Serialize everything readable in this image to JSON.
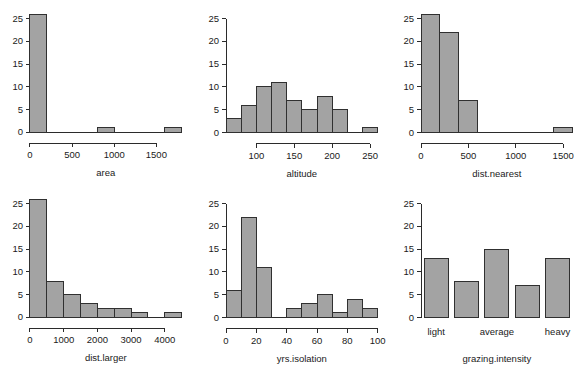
{
  "figure": {
    "layout": "2x3 grid of histograms",
    "background_color": "#ffffff",
    "bar_fill_color": "#a3a3a3",
    "bar_border_color": "#303030",
    "axis_color": "#2b2b2b",
    "text_color": "#1a1a1a"
  },
  "chart_data": [
    {
      "type": "bar",
      "title": "",
      "xlabel": "area",
      "ylabel": "",
      "grid": false,
      "legend": "none",
      "ylim": [
        0,
        26
      ],
      "y_ticks": [
        0,
        5,
        10,
        15,
        20,
        25
      ],
      "y_tick_labels": [
        "0",
        "5",
        "10",
        "15",
        "20",
        "25"
      ],
      "xlim": [
        0,
        1800
      ],
      "x_ticks": [
        0,
        500,
        1000,
        1500
      ],
      "x_tick_labels": [
        "0",
        "500",
        "1000",
        "1500"
      ],
      "bin_edges": [
        0,
        200,
        400,
        600,
        800,
        1000,
        1200,
        1400,
        1600,
        1800
      ],
      "categories": [
        "0-200",
        "200-400",
        "400-600",
        "600-800",
        "800-1000",
        "1000-1200",
        "1200-1400",
        "1400-1600",
        "1600-1800"
      ],
      "values": [
        26,
        0,
        0,
        0,
        1,
        0,
        0,
        0,
        1
      ]
    },
    {
      "type": "bar",
      "title": "",
      "xlabel": "altitude",
      "ylabel": "",
      "grid": false,
      "legend": "none",
      "ylim": [
        0,
        26
      ],
      "y_ticks": [
        0,
        5,
        10,
        15,
        20,
        25
      ],
      "y_tick_labels": [
        "0",
        "5",
        "10",
        "15",
        "20",
        "25"
      ],
      "xlim": [
        60,
        260
      ],
      "x_ticks": [
        100,
        150,
        200,
        250
      ],
      "x_tick_labels": [
        "100",
        "150",
        "200",
        "250"
      ],
      "bin_edges": [
        60,
        80,
        100,
        120,
        140,
        160,
        180,
        200,
        220,
        240,
        260
      ],
      "categories": [
        "60-80",
        "80-100",
        "100-120",
        "120-140",
        "140-160",
        "160-180",
        "180-200",
        "200-220",
        "220-240",
        "240-260"
      ],
      "values": [
        3,
        6,
        10,
        11,
        7,
        5,
        8,
        5,
        0,
        1
      ]
    },
    {
      "type": "bar",
      "title": "",
      "xlabel": "dist.nearest",
      "ylabel": "",
      "grid": false,
      "legend": "none",
      "ylim": [
        0,
        26
      ],
      "y_ticks": [
        0,
        5,
        10,
        15,
        20,
        25
      ],
      "y_tick_labels": [
        "0",
        "5",
        "10",
        "15",
        "20",
        "25"
      ],
      "xlim": [
        0,
        1600
      ],
      "x_ticks": [
        0,
        500,
        1000,
        1500
      ],
      "x_tick_labels": [
        "0",
        "500",
        "1000",
        "1500"
      ],
      "bin_edges": [
        0,
        200,
        400,
        600,
        800,
        1000,
        1200,
        1400,
        1600
      ],
      "categories": [
        "0-200",
        "200-400",
        "400-600",
        "600-800",
        "800-1000",
        "1000-1200",
        "1200-1400",
        "1400-1600"
      ],
      "values": [
        26,
        22,
        7,
        0,
        0,
        0,
        0,
        1
      ]
    },
    {
      "type": "bar",
      "title": "",
      "xlabel": "dist.larger",
      "ylabel": "",
      "grid": false,
      "legend": "none",
      "ylim": [
        0,
        26
      ],
      "y_ticks": [
        0,
        5,
        10,
        15,
        20,
        25
      ],
      "y_tick_labels": [
        "0",
        "5",
        "10",
        "15",
        "20",
        "25"
      ],
      "xlim": [
        0,
        4500
      ],
      "x_ticks": [
        0,
        1000,
        2000,
        3000,
        4000
      ],
      "x_tick_labels": [
        "0",
        "1000",
        "2000",
        "3000",
        "4000"
      ],
      "bin_edges": [
        0,
        500,
        1000,
        1500,
        2000,
        2500,
        3000,
        3500,
        4000,
        4500
      ],
      "categories": [
        "0-500",
        "500-1000",
        "1000-1500",
        "1500-2000",
        "2000-2500",
        "2500-3000",
        "3000-3500",
        "3500-4000",
        "4000-4500"
      ],
      "values": [
        26,
        8,
        5,
        3,
        2,
        2,
        1,
        0,
        1
      ]
    },
    {
      "type": "bar",
      "title": "",
      "xlabel": "yrs.isolation",
      "ylabel": "",
      "grid": false,
      "legend": "none",
      "ylim": [
        0,
        26
      ],
      "y_ticks": [
        0,
        5,
        10,
        15,
        20,
        25
      ],
      "y_tick_labels": [
        "0",
        "5",
        "10",
        "15",
        "20",
        "25"
      ],
      "xlim": [
        0,
        100
      ],
      "x_ticks": [
        0,
        20,
        40,
        60,
        80,
        100
      ],
      "x_tick_labels": [
        "0",
        "20",
        "40",
        "60",
        "80",
        "100"
      ],
      "bin_edges": [
        0,
        10,
        20,
        30,
        40,
        50,
        60,
        70,
        80,
        90,
        100
      ],
      "categories": [
        "0-10",
        "10-20",
        "20-30",
        "30-40",
        "40-50",
        "50-60",
        "60-70",
        "70-80",
        "80-90",
        "90-100"
      ],
      "values": [
        6,
        22,
        11,
        0,
        2,
        3,
        5,
        1,
        4,
        2
      ]
    },
    {
      "type": "bar",
      "title": "",
      "xlabel": "grazing.intensity",
      "ylabel": "",
      "grid": false,
      "legend": "none",
      "ylim": [
        0,
        26
      ],
      "y_ticks": [
        0,
        5,
        10,
        15,
        20,
        25
      ],
      "y_tick_labels": [
        "0",
        "5",
        "10",
        "15",
        "20",
        "25"
      ],
      "categorical": true,
      "categories": [
        "1",
        "2",
        "3",
        "4",
        "5"
      ],
      "x_tick_labels": [
        "light",
        "",
        "average",
        "",
        "heavy"
      ],
      "values": [
        13,
        8,
        15,
        7,
        13
      ]
    }
  ]
}
